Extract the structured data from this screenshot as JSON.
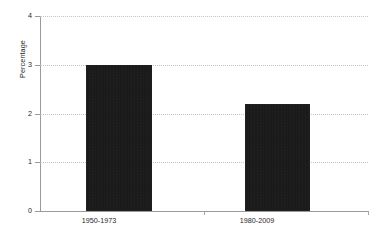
{
  "chart_data": {
    "type": "bar",
    "title": "",
    "subtitle": "",
    "xlabel": "",
    "ylabel": "Percentage",
    "categories": [
      "1950-1973",
      "1980-2009"
    ],
    "values": [
      3.0,
      2.2
    ],
    "series": [
      {
        "name": "Percentage",
        "values": [
          3.0,
          2.2
        ]
      }
    ],
    "ylim": [
      0,
      4
    ],
    "y_ticks": [
      "0",
      "1",
      "2",
      "3",
      "4"
    ],
    "y_tick_values": [
      0,
      1,
      2,
      3,
      4
    ],
    "grid": true,
    "grid_axis": "y",
    "legend": false,
    "legend_position": "none",
    "bar_color": "#151515",
    "gridline_color": "#c6c6c6",
    "axis_color": "#9a9a9a",
    "text_color": "#1f1f1f",
    "background_color": "#ffffff",
    "annotations": []
  }
}
